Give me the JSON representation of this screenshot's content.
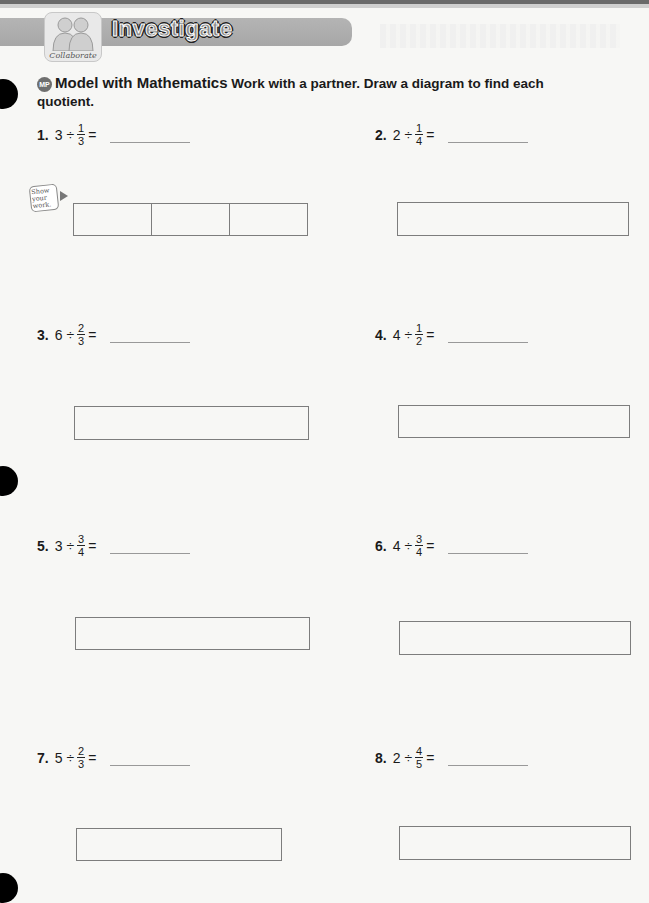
{
  "header": {
    "banner_title": "Investigate",
    "badge_label": "Collaborate"
  },
  "instructions": {
    "mp_badge": "MP",
    "heading": "Model with Mathematics",
    "text": " Work with a partner. Draw a diagram to find each quotient."
  },
  "show_work": {
    "line1": "Show",
    "line2": "your",
    "line3": "work."
  },
  "problems": [
    {
      "number": "1.",
      "whole": "3",
      "op": "÷",
      "num": "1",
      "den": "3",
      "eq": "=",
      "answer": ""
    },
    {
      "number": "2.",
      "whole": "2",
      "op": "÷",
      "num": "1",
      "den": "4",
      "eq": "=",
      "answer": ""
    },
    {
      "number": "3.",
      "whole": "6",
      "op": "÷",
      "num": "2",
      "den": "3",
      "eq": "=",
      "answer": ""
    },
    {
      "number": "4.",
      "whole": "4",
      "op": "÷",
      "num": "1",
      "den": "2",
      "eq": "=",
      "answer": ""
    },
    {
      "number": "5.",
      "whole": "3",
      "op": "÷",
      "num": "3",
      "den": "4",
      "eq": "=",
      "answer": ""
    },
    {
      "number": "6.",
      "whole": "4",
      "op": "÷",
      "num": "3",
      "den": "4",
      "eq": "=",
      "answer": ""
    },
    {
      "number": "7.",
      "whole": "5",
      "op": "÷",
      "num": "2",
      "den": "3",
      "eq": "=",
      "answer": ""
    },
    {
      "number": "8.",
      "whole": "2",
      "op": "÷",
      "num": "4",
      "den": "5",
      "eq": "=",
      "answer": ""
    }
  ],
  "colors": {
    "banner": "#aeaeae",
    "box_border": "#7d7d7d",
    "mp_badge": "#6f6f6f"
  }
}
